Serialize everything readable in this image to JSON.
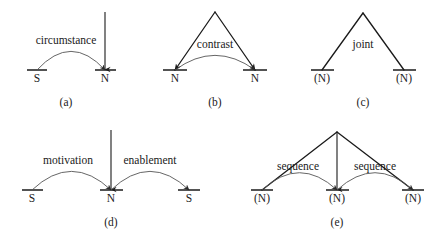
{
  "figure": {
    "background_color": "#ffffff",
    "line_color": "#1a1a1a",
    "arc_color": "#555555",
    "diagrams": [
      {
        "id": "a",
        "caption": "(a)",
        "caption_x": 66,
        "caption_y": 102,
        "relations": [
          {
            "label": "circumstance",
            "x": 66,
            "y": 40
          }
        ],
        "nodes": [
          {
            "label": "S",
            "x": 37,
            "y": 78
          },
          {
            "label": "N",
            "x": 105,
            "y": 78
          }
        ],
        "spans": [
          {
            "x1": 27,
            "x2": 47,
            "y": 70
          },
          {
            "x1": 95,
            "x2": 116,
            "y": 70
          }
        ],
        "verticals": [
          {
            "x": 105,
            "y1": 12,
            "y2": 70
          }
        ],
        "arcs": [
          {
            "x1": 37,
            "x2": 105,
            "y": 70,
            "lift": 28
          }
        ],
        "satellite_lines": []
      },
      {
        "id": "b",
        "caption": "(b)",
        "caption_x": 215,
        "caption_y": 102,
        "relations": [
          {
            "label": "contrast",
            "x": 215,
            "y": 44
          }
        ],
        "nodes": [
          {
            "label": "N",
            "x": 175,
            "y": 78
          },
          {
            "label": "N",
            "x": 255,
            "y": 78
          }
        ],
        "spans": [
          {
            "x1": 163,
            "x2": 187,
            "y": 70
          },
          {
            "x1": 243,
            "x2": 267,
            "y": 70
          }
        ],
        "verticals": [],
        "arcs": [
          {
            "x1": 175,
            "x2": 255,
            "y": 70,
            "lift": 22
          }
        ],
        "satellite_lines": [
          {
            "x1": 215,
            "y1": 12,
            "x2": 175,
            "y2": 70,
            "arrow": true
          },
          {
            "x1": 215,
            "y1": 12,
            "x2": 255,
            "y2": 70,
            "arrow": true
          }
        ]
      },
      {
        "id": "c",
        "caption": "(c)",
        "caption_x": 363,
        "caption_y": 102,
        "relations": [
          {
            "label": "joint",
            "x": 363,
            "y": 44
          }
        ],
        "nodes": [
          {
            "label": "(N)",
            "x": 322,
            "y": 78
          },
          {
            "label": "(N)",
            "x": 404,
            "y": 78
          }
        ],
        "spans": [
          {
            "x1": 311,
            "x2": 334,
            "y": 70
          },
          {
            "x1": 393,
            "x2": 416,
            "y": 70
          }
        ],
        "verticals": [],
        "arcs": [],
        "satellite_lines": [
          {
            "x1": 363,
            "y1": 13,
            "x2": 322,
            "y2": 70,
            "arrow": false
          },
          {
            "x1": 363,
            "y1": 13,
            "x2": 404,
            "y2": 70,
            "arrow": false
          }
        ]
      },
      {
        "id": "d",
        "caption": "(d)",
        "caption_x": 111,
        "caption_y": 222,
        "relations": [
          {
            "label": "motivation",
            "x": 68,
            "y": 160
          },
          {
            "label": "enablement",
            "x": 150,
            "y": 160
          }
        ],
        "nodes": [
          {
            "label": "S",
            "x": 32,
            "y": 198
          },
          {
            "label": "N",
            "x": 111,
            "y": 198
          },
          {
            "label": "S",
            "x": 189,
            "y": 198
          }
        ],
        "spans": [
          {
            "x1": 22,
            "x2": 43,
            "y": 190
          },
          {
            "x1": 100,
            "x2": 123,
            "y": 190
          },
          {
            "x1": 178,
            "x2": 200,
            "y": 190
          }
        ],
        "verticals": [
          {
            "x": 111,
            "y1": 130,
            "y2": 190
          }
        ],
        "arcs": [
          {
            "x1": 32,
            "x2": 111,
            "y": 190,
            "lift": 28
          },
          {
            "x1": 111,
            "x2": 189,
            "y": 190,
            "lift": 28
          }
        ],
        "satellite_lines": []
      },
      {
        "id": "e",
        "caption": "(e)",
        "caption_x": 337,
        "caption_y": 222,
        "relations": [
          {
            "label": "sequence",
            "x": 298,
            "y": 166
          },
          {
            "label": "sequence",
            "x": 375,
            "y": 166
          }
        ],
        "nodes": [
          {
            "label": "(N)",
            "x": 262,
            "y": 198
          },
          {
            "label": "(N)",
            "x": 337,
            "y": 198
          },
          {
            "label": "(N)",
            "x": 413,
            "y": 198
          }
        ],
        "spans": [
          {
            "x1": 251,
            "x2": 273,
            "y": 190
          },
          {
            "x1": 326,
            "x2": 349,
            "y": 190
          },
          {
            "x1": 402,
            "x2": 424,
            "y": 190
          }
        ],
        "verticals": [
          {
            "x": 337,
            "y1": 132,
            "y2": 190
          }
        ],
        "arcs": [
          {
            "x1": 262,
            "x2": 337,
            "y": 190,
            "lift": 26
          },
          {
            "x1": 337,
            "x2": 413,
            "y": 190,
            "lift": 26
          }
        ],
        "satellite_lines": [
          {
            "x1": 337,
            "y1": 132,
            "x2": 262,
            "y2": 190,
            "arrow": false
          },
          {
            "x1": 337,
            "y1": 132,
            "x2": 413,
            "y2": 190,
            "arrow": false
          }
        ]
      }
    ]
  }
}
